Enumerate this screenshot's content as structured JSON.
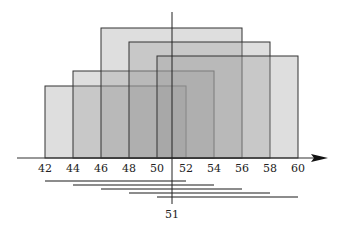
{
  "diagram": {
    "axis": {
      "ticks": [
        "42",
        "44",
        "46",
        "48",
        "50",
        "52",
        "54",
        "56",
        "58",
        "60"
      ],
      "min": 42,
      "max": 60
    },
    "marker": {
      "label": "51",
      "value": 51
    },
    "windows": [
      {
        "start": 42,
        "end": 52
      },
      {
        "start": 44,
        "end": 54
      },
      {
        "start": 46,
        "end": 56
      },
      {
        "start": 48,
        "end": 58
      },
      {
        "start": 50,
        "end": 60
      }
    ],
    "colors": {
      "fill": "#9a9a9a",
      "stroke": "#333333",
      "bars": "#8c8c8c"
    }
  }
}
